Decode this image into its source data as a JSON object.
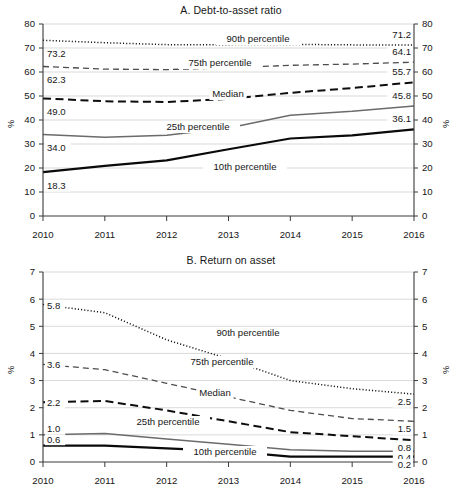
{
  "figure": {
    "panels": [
      {
        "id": "A",
        "title": "A. Debt-to-asset ratio",
        "y_axis_name": "%",
        "y_axis_name_right": "%"
      },
      {
        "id": "B",
        "title": "B. Return on asset",
        "y_axis_name": "%",
        "y_axis_name_right": "%"
      }
    ]
  },
  "chart_data": [
    {
      "type": "line",
      "panel": "A",
      "title": "A. Debt-to-asset ratio",
      "xlabel": "",
      "ylabel": "%",
      "ylabel_right": "%",
      "grid": true,
      "legend_position": "inline-annotations",
      "x": [
        2010,
        2011,
        2012,
        2013,
        2014,
        2015,
        2016
      ],
      "xtick_labels": [
        "2010",
        "2011",
        "2012",
        "2013",
        "2014",
        "2015",
        "2016"
      ],
      "ylim": [
        0,
        80
      ],
      "ytick_labels": [
        "0",
        "10",
        "20",
        "30",
        "40",
        "50",
        "60",
        "70",
        "80"
      ],
      "ytick_values": [
        0,
        10,
        20,
        30,
        40,
        50,
        60,
        70,
        80
      ],
      "ylim_right": [
        0,
        80
      ],
      "ytick_labels_right": [
        "0",
        "10",
        "20",
        "30",
        "40",
        "50",
        "60",
        "70",
        "80"
      ],
      "series": [
        {
          "name": "90th percentile",
          "label": "90th percentile",
          "style": "dotted",
          "start_label": "73.2",
          "end_label": "71.2",
          "values": [
            73.2,
            72.2,
            71.4,
            71.4,
            71.5,
            71.3,
            71.2
          ]
        },
        {
          "name": "75th percentile",
          "label": "75th percentile",
          "style": "dashed-thin",
          "start_label": "62.3",
          "end_label": "64.1",
          "values": [
            62.3,
            61.2,
            61.0,
            61.7,
            62.8,
            63.3,
            64.1
          ]
        },
        {
          "name": "Median",
          "label": "Median",
          "style": "dashed-thick",
          "start_label": "49.0",
          "end_label": "55.7",
          "values": [
            49.0,
            47.8,
            47.5,
            48.8,
            51.3,
            53.3,
            55.7
          ]
        },
        {
          "name": "25th percentile",
          "label": "25th percentile",
          "style": "solid-gray",
          "start_label": "34.0",
          "end_label": "45.8",
          "values": [
            34.0,
            32.8,
            33.6,
            36.7,
            42.0,
            43.6,
            45.8
          ]
        },
        {
          "name": "10th percentile",
          "label": "10th percentile",
          "style": "solid-black",
          "start_label": "18.3",
          "end_label": "36.1",
          "values": [
            18.3,
            20.9,
            23.2,
            27.8,
            32.3,
            33.6,
            36.1
          ]
        }
      ]
    },
    {
      "type": "line",
      "panel": "B",
      "title": "B. Return on asset",
      "xlabel": "",
      "ylabel": "%",
      "ylabel_right": "%",
      "grid": true,
      "legend_position": "inline-annotations",
      "x": [
        2010,
        2011,
        2012,
        2013,
        2014,
        2015,
        2016
      ],
      "xtick_labels": [
        "2010",
        "2011",
        "2012",
        "2013",
        "2014",
        "2015",
        "2016"
      ],
      "ylim": [
        0,
        7
      ],
      "ytick_labels": [
        "0",
        "1",
        "2",
        "3",
        "4",
        "5",
        "6",
        "7"
      ],
      "ytick_values": [
        0,
        1,
        2,
        3,
        4,
        5,
        6,
        7
      ],
      "ylim_right": [
        0,
        7
      ],
      "ytick_labels_right": [
        "0",
        "1",
        "2",
        "3",
        "4",
        "5",
        "6",
        "7"
      ],
      "series": [
        {
          "name": "90th percentile",
          "label": "90th percentile",
          "style": "dotted",
          "start_label": "5.8",
          "end_label": "2.5",
          "values": [
            5.8,
            5.5,
            4.5,
            3.8,
            3.0,
            2.7,
            2.5
          ]
        },
        {
          "name": "75th percentile",
          "label": "75th percentile",
          "style": "dashed-thin",
          "start_label": "3.6",
          "end_label": "1.5",
          "values": [
            3.6,
            3.4,
            2.9,
            2.4,
            1.9,
            1.6,
            1.5
          ]
        },
        {
          "name": "Median",
          "label": "Median",
          "style": "dashed-thick",
          "start_label": "2.2",
          "end_label": "0.8",
          "values": [
            2.2,
            2.25,
            1.9,
            1.5,
            1.1,
            0.95,
            0.8
          ]
        },
        {
          "name": "25th percentile",
          "label": "25th percentile",
          "style": "solid-gray",
          "start_label": "1.0",
          "end_label": "0.4",
          "values": [
            1.0,
            1.05,
            0.85,
            0.65,
            0.45,
            0.4,
            0.4
          ]
        },
        {
          "name": "10th percentile",
          "label": "10th percentile",
          "style": "solid-black",
          "start_label": "0.6",
          "end_label": "0.2",
          "values": [
            0.6,
            0.6,
            0.5,
            0.4,
            0.2,
            0.2,
            0.2
          ]
        }
      ]
    }
  ]
}
